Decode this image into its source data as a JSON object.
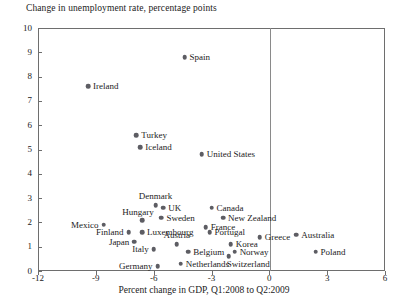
{
  "chart_data": {
    "type": "scatter",
    "title": "Change in unemployment rate, percentage points",
    "xlabel": "Percent change in GDP, Q1:2008 to Q2:2009",
    "ylabel": "Change in unemployment rate, percentage points",
    "xlim": [
      -12,
      6
    ],
    "ylim": [
      0,
      10
    ],
    "xticks": [
      -12,
      -9,
      -6,
      -3,
      0,
      3,
      6
    ],
    "yticks": [
      0,
      1,
      2,
      3,
      4,
      5,
      6,
      7,
      8,
      9,
      10
    ],
    "grid": false,
    "legend": "none",
    "annotations": [
      "Vertical reference line at x = 0"
    ],
    "points": [
      {
        "label": "Spain",
        "x": -4.4,
        "y": 8.8,
        "lpos": "r"
      },
      {
        "label": "Ireland",
        "x": -9.4,
        "y": 7.6,
        "lpos": "r"
      },
      {
        "label": "Turkey",
        "x": -6.9,
        "y": 5.6,
        "lpos": "r"
      },
      {
        "label": "Iceland",
        "x": -6.7,
        "y": 5.1,
        "lpos": "r"
      },
      {
        "label": "United States",
        "x": -3.5,
        "y": 4.8,
        "lpos": "r"
      },
      {
        "label": "Denmark",
        "x": -5.9,
        "y": 2.7,
        "lpos": "c-above"
      },
      {
        "label": "UK",
        "x": -5.5,
        "y": 2.6,
        "lpos": "r"
      },
      {
        "label": "Canada",
        "x": -3.0,
        "y": 2.6,
        "lpos": "r"
      },
      {
        "label": "Sweden",
        "x": -5.6,
        "y": 2.2,
        "lpos": "r"
      },
      {
        "label": "Hungary",
        "x": -6.6,
        "y": 2.1,
        "lpos": "l-above"
      },
      {
        "label": "New Zealand",
        "x": -2.4,
        "y": 2.2,
        "lpos": "r"
      },
      {
        "label": "Mexico",
        "x": -8.6,
        "y": 1.9,
        "lpos": "l"
      },
      {
        "label": "France",
        "x": -3.3,
        "y": 1.8,
        "lpos": "r"
      },
      {
        "label": "Luxembourg",
        "x": -6.6,
        "y": 1.6,
        "lpos": "r"
      },
      {
        "label": "Finland",
        "x": -7.3,
        "y": 1.6,
        "lpos": "l"
      },
      {
        "label": "Portugal",
        "x": -3.1,
        "y": 1.6,
        "lpos": "r"
      },
      {
        "label": "Australia",
        "x": 1.4,
        "y": 1.5,
        "lpos": "r"
      },
      {
        "label": "Greece",
        "x": -0.5,
        "y": 1.4,
        "lpos": "r"
      },
      {
        "label": "Japan",
        "x": -7.0,
        "y": 1.2,
        "lpos": "l"
      },
      {
        "label": "Austria",
        "x": -4.8,
        "y": 1.1,
        "lpos": "c-above"
      },
      {
        "label": "Korea",
        "x": -2.0,
        "y": 1.1,
        "lpos": "r"
      },
      {
        "label": "Italy",
        "x": -6.0,
        "y": 0.9,
        "lpos": "l"
      },
      {
        "label": "Norway",
        "x": -1.8,
        "y": 0.8,
        "lpos": "r"
      },
      {
        "label": "Belgium",
        "x": -4.2,
        "y": 0.8,
        "lpos": "r"
      },
      {
        "label": "Poland",
        "x": 2.4,
        "y": 0.8,
        "lpos": "r"
      },
      {
        "label": "Switzerland",
        "x": -2.1,
        "y": 0.6,
        "lpos": "r-below"
      },
      {
        "label": "Netherlands",
        "x": -4.6,
        "y": 0.3,
        "lpos": "r"
      },
      {
        "label": "Germany",
        "x": -5.8,
        "y": 0.2,
        "lpos": "l"
      }
    ]
  }
}
